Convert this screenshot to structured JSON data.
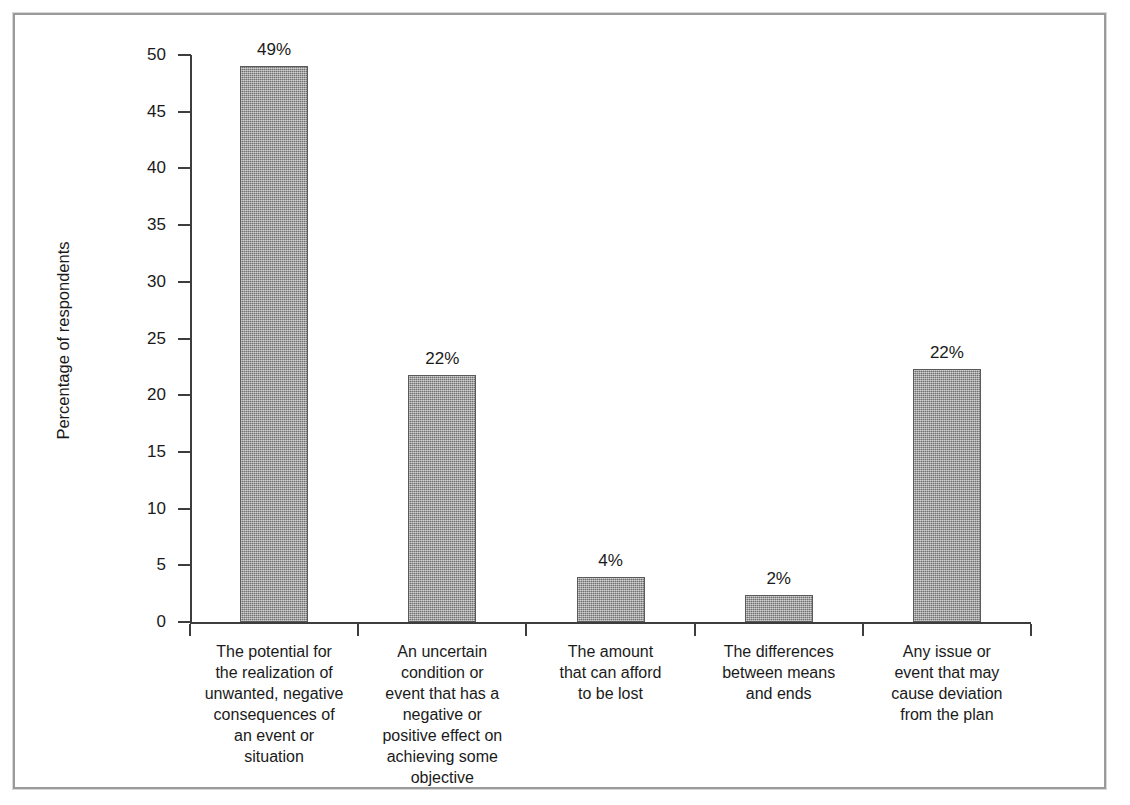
{
  "chart_data": {
    "type": "bar",
    "title": "",
    "subtitle": "",
    "xlabel": "",
    "ylabel": "Percentage of respondents",
    "ylim": [
      0,
      50
    ],
    "ytick_step": 5,
    "ytick_labels": [
      "0",
      "5",
      "10",
      "15",
      "20",
      "25",
      "30",
      "35",
      "40",
      "45",
      "50"
    ],
    "ytick_values": [
      0,
      5,
      10,
      15,
      20,
      25,
      30,
      35,
      40,
      45,
      50
    ],
    "grid": false,
    "legend": null,
    "legend_position": "none",
    "categories": [
      "The potential for the realization of unwanted, negative consequences of an event or situation",
      "An uncertain condition or event that has a negative or positive effect on achieving some objective",
      "The amount that can afford to be lost",
      "The differences between means and ends",
      "Any issue or event that may cause deviation from the plan"
    ],
    "category_lines": [
      [
        "The potential for",
        "the realization of",
        "unwanted, negative",
        "consequences of",
        "an event or",
        "situation"
      ],
      [
        "An uncertain",
        "condition or",
        "event that has a",
        "negative or",
        "positive effect on",
        "achieving some",
        "objective"
      ],
      [
        "The amount",
        "that can afford",
        "to be lost"
      ],
      [
        "The differences",
        "between means",
        "and ends"
      ],
      [
        "Any issue or",
        "event that may",
        "cause deviation",
        "from the plan"
      ]
    ],
    "values": [
      49.0,
      21.8,
      4.0,
      2.4,
      22.3
    ],
    "data_labels": [
      "49%",
      "22%",
      "4%",
      "2%",
      "22%"
    ],
    "bar_color": "#909090",
    "bar_edge_color": "#5a5a5a",
    "axis_color": "#3d3d3d",
    "background_color": "#ffffff",
    "frame_color": "#9a9a9a"
  },
  "figure": {
    "frame_present": true
  }
}
